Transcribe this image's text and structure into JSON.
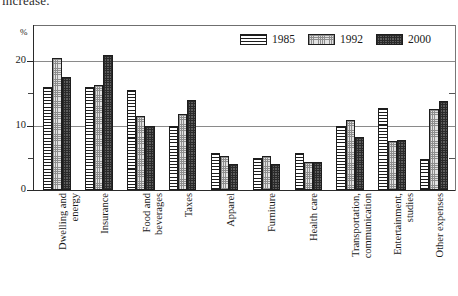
{
  "caption_fragment": "increase.",
  "axis_unit_label": "%",
  "legend": {
    "items": [
      {
        "label": "1985",
        "pattern": "horizontal-lines",
        "color": "#ffffff"
      },
      {
        "label": "1992",
        "pattern": "light-stipple",
        "color": "#e2e2e2"
      },
      {
        "label": "2000",
        "pattern": "dark-crosshatch",
        "color": "#5d5d5d"
      }
    ]
  },
  "chart_data": {
    "type": "bar",
    "title": "",
    "xlabel": "",
    "ylabel": "%",
    "ylim": [
      0,
      25.6
    ],
    "yticks": [
      0,
      10,
      20
    ],
    "yticks_minor": [
      5,
      15
    ],
    "grid": true,
    "legend_position": "top-right",
    "categories": [
      "Dwelling and energy",
      "Insurance",
      "Food and beverages",
      "Taxes",
      "Apparel",
      "Furniture",
      "Health care",
      "Transportation, communication",
      "Entertainment, studies",
      "Other expenses"
    ],
    "category_lines": [
      [
        "Dwelling and",
        "energy"
      ],
      [
        "Insurance"
      ],
      [
        "Food and",
        "beverages"
      ],
      [
        "Taxes"
      ],
      [
        "Apparel"
      ],
      [
        "Furniture"
      ],
      [
        "Health care"
      ],
      [
        "Transportation,",
        "communication"
      ],
      [
        "Entertainment,",
        "studies"
      ],
      [
        "Other expenses"
      ]
    ],
    "series": [
      {
        "name": "1985",
        "values": [
          16.0,
          16.0,
          15.5,
          10.0,
          5.7,
          5.0,
          5.8,
          10.0,
          12.7,
          4.8
        ]
      },
      {
        "name": "1992",
        "values": [
          20.5,
          16.3,
          11.5,
          11.8,
          5.3,
          5.2,
          4.3,
          10.8,
          7.6,
          12.6
        ]
      },
      {
        "name": "2000",
        "values": [
          17.5,
          21.0,
          10.0,
          14.0,
          4.0,
          4.0,
          4.3,
          8.3,
          7.8,
          13.8
        ]
      }
    ]
  }
}
